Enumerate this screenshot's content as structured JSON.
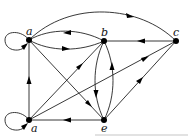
{
  "diagram": {
    "type": "directed-graph",
    "nodes": [
      {
        "id": "a_top",
        "label": "a",
        "x": 29,
        "y": 40
      },
      {
        "id": "b",
        "label": "b",
        "x": 104,
        "y": 41
      },
      {
        "id": "c",
        "label": "c",
        "x": 176,
        "y": 41
      },
      {
        "id": "a_bot",
        "label": "a",
        "x": 29,
        "y": 120
      },
      {
        "id": "e",
        "label": "e",
        "x": 104,
        "y": 120
      }
    ],
    "edges": [
      {
        "from": "a_top",
        "to": "a_top",
        "kind": "loop"
      },
      {
        "from": "a_bot",
        "to": "a_bot",
        "kind": "loop"
      },
      {
        "from": "a_top",
        "to": "c",
        "kind": "arc-upper"
      },
      {
        "from": "b",
        "to": "a_top",
        "kind": "arc-upper"
      },
      {
        "from": "a_top",
        "to": "b",
        "kind": "arc-lower"
      },
      {
        "from": "c",
        "to": "b",
        "kind": "straight"
      },
      {
        "from": "a_bot",
        "to": "a_top",
        "kind": "straight"
      },
      {
        "from": "a_top",
        "to": "e",
        "kind": "straight"
      },
      {
        "from": "a_bot",
        "to": "b",
        "kind": "straight"
      },
      {
        "from": "a_bot",
        "to": "c",
        "kind": "straight"
      },
      {
        "from": "b",
        "to": "e",
        "kind": "arc-left"
      },
      {
        "from": "e",
        "to": "b",
        "kind": "arc-right"
      },
      {
        "from": "e",
        "to": "a_bot",
        "kind": "straight"
      },
      {
        "from": "e",
        "to": "c",
        "kind": "straight"
      }
    ]
  },
  "labels": {
    "a_top": "a",
    "b": "b",
    "c": "c",
    "a_bot": "a",
    "e": "e"
  }
}
